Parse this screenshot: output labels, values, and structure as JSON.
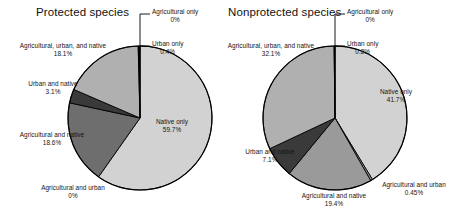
{
  "figure": {
    "background": "#ffffff",
    "outline_color": "#000000"
  },
  "charts": [
    {
      "title": "Protected species",
      "slices": [
        {
          "label": "Native only",
          "pct_label": "59.7%",
          "value": 59.7,
          "color": "#d2d2d2"
        },
        {
          "label": "Agricultural and urban",
          "pct_label": "0%",
          "value": 0.0,
          "color": "#9a9a9a"
        },
        {
          "label": "Agricultural and native",
          "pct_label": "18.6%",
          "value": 18.6,
          "color": "#6e6e6e"
        },
        {
          "label": "Urban and native",
          "pct_label": "3.1%",
          "value": 3.1,
          "color": "#3a3a3a"
        },
        {
          "label": "Agricultural, urban, and native",
          "pct_label": "18.1%",
          "value": 18.1,
          "color": "#b0b0b0"
        },
        {
          "label": "Urban only",
          "pct_label": "0.4%",
          "value": 0.4,
          "color": "#000000"
        },
        {
          "label": "Agricultural only",
          "pct_label": "0%",
          "value": 0.0,
          "color": "#ffffff"
        }
      ]
    },
    {
      "title": "Nonprotected species",
      "slices": [
        {
          "label": "Native only",
          "pct_label": "41.7%",
          "value": 41.7,
          "color": "#d2d2d2"
        },
        {
          "label": "Agricultural and urban",
          "pct_label": "0.45%",
          "value": 0.45,
          "color": "#9a9a9a"
        },
        {
          "label": "Agricultural and native",
          "pct_label": "19.4%",
          "value": 19.4,
          "color": "#9a9a9a"
        },
        {
          "label": "Urban and native",
          "pct_label": "7.1%",
          "value": 7.1,
          "color": "#3a3a3a"
        },
        {
          "label": "Agricultural, urban, and native",
          "pct_label": "32.1%",
          "value": 32.1,
          "color": "#b0b0b0"
        },
        {
          "label": "Urban only",
          "pct_label": "0.2%",
          "value": 0.2,
          "color": "#000000"
        },
        {
          "label": "Agricultural only",
          "pct_label": "0%",
          "value": 0.0,
          "color": "#ffffff"
        }
      ]
    }
  ],
  "chart_data": [
    {
      "type": "pie",
      "title": "Protected species",
      "categories": [
        "Native only",
        "Agricultural and urban",
        "Agricultural and native",
        "Urban and native",
        "Agricultural, urban, and native",
        "Urban only",
        "Agricultural only"
      ],
      "values": [
        59.7,
        0.0,
        18.6,
        3.1,
        18.1,
        0.4,
        0.0
      ],
      "value_labels": [
        "59.7%",
        "0%",
        "18.6%",
        "3.1%",
        "18.1%",
        "0.4%",
        "0%"
      ],
      "units": "percent",
      "legend": "none (direct slice labels)",
      "start_angle_deg": -90,
      "direction": "clockwise"
    },
    {
      "type": "pie",
      "title": "Nonprotected species",
      "categories": [
        "Native only",
        "Agricultural and urban",
        "Agricultural and native",
        "Urban and native",
        "Agricultural, urban, and native",
        "Urban only",
        "Agricultural only"
      ],
      "values": [
        41.7,
        0.45,
        19.4,
        7.1,
        32.1,
        0.2,
        0.0
      ],
      "value_labels": [
        "41.7%",
        "0.45%",
        "19.4%",
        "7.1%",
        "32.1%",
        "0.2%",
        "0%"
      ],
      "units": "percent",
      "legend": "none (direct slice labels)",
      "start_angle_deg": -90,
      "direction": "clockwise"
    }
  ]
}
